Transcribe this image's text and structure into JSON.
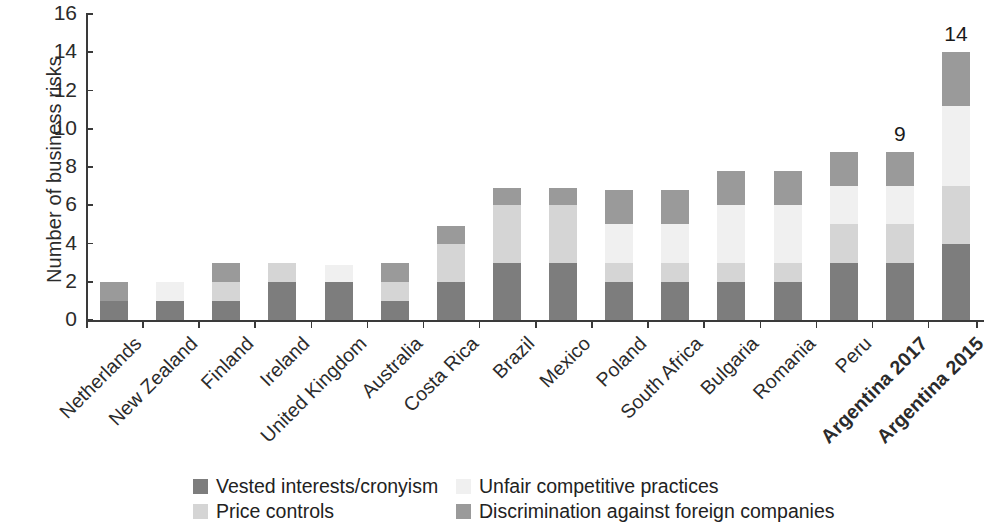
{
  "chart_data": {
    "type": "bar",
    "stacked": true,
    "title": "",
    "xlabel": "",
    "ylabel": "Number of business risks",
    "ylim": [
      0,
      16
    ],
    "yticks": [
      0,
      2,
      4,
      6,
      8,
      10,
      12,
      14,
      16
    ],
    "grid": false,
    "legend_position": "bottom",
    "categories": [
      "Netherlands",
      "New Zealand",
      "Finland",
      "Ireland",
      "United Kingdom",
      "Australia",
      "Costa Rica",
      "Brazil",
      "Mexico",
      "Poland",
      "South Africa",
      "Bulgaria",
      "Romania",
      "Peru",
      "Argentina 2017",
      "Argentina 2015"
    ],
    "emphasized_categories": [
      "Argentina 2017",
      "Argentina 2015"
    ],
    "series": [
      {
        "name": "Vested interests/cronyism",
        "color": "#7d7d7d",
        "values": [
          1,
          1,
          1,
          2,
          2,
          1,
          2,
          3,
          3,
          2,
          2,
          2,
          2,
          3,
          3,
          4
        ]
      },
      {
        "name": "Price controls",
        "color": "#d5d5d5",
        "values": [
          0,
          0,
          1,
          1,
          0,
          1,
          2,
          3,
          3,
          1,
          1,
          1,
          1,
          2,
          2,
          3
        ]
      },
      {
        "name": "Unfair competitive practices",
        "color": "#f0f0f0",
        "values": [
          0,
          1,
          0,
          0,
          0.9,
          0,
          0,
          0,
          0,
          2,
          2,
          3,
          3,
          2,
          2,
          4.2
        ]
      },
      {
        "name": "Discrimination against foreign companies",
        "color": "#9a9a9a",
        "values": [
          1,
          0,
          1,
          0,
          0,
          1,
          0.9,
          0.9,
          0.9,
          1.8,
          1.8,
          1.8,
          1.8,
          1.8,
          1.8,
          2.8
        ]
      }
    ],
    "totals": [
      2,
      2,
      3,
      3,
      2.9,
      3,
      5.9,
      6.9,
      6.9,
      6.8,
      6.8,
      7.8,
      7.8,
      8.8,
      8.8,
      14
    ],
    "data_labels": {
      "Argentina 2017": "9",
      "Argentina 2015": "14"
    },
    "legend": [
      {
        "label": "Vested interests/cronyism",
        "color": "#7d7d7d"
      },
      {
        "label": "Unfair competitive practices",
        "color": "#f0f0f0"
      },
      {
        "label": "Price controls",
        "color": "#d5d5d5"
      },
      {
        "label": "Discrimination against foreign companies",
        "color": "#9a9a9a"
      }
    ]
  }
}
